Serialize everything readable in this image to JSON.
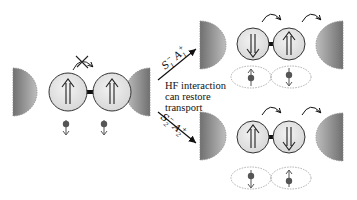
{
  "diagram": {
    "type": "spin-blockade-transport-schematic",
    "caption_lines": [
      "HF interaction",
      "can restore",
      "transport"
    ],
    "arrow_labels": {
      "top": {
        "operator1": "S",
        "sub1": "1",
        "sup1": "−",
        "operator2": "A",
        "sub2": "1",
        "sup2": "+"
      },
      "bottom": {
        "operator1": "S",
        "sub1": "2",
        "sup1": "−",
        "operator2": "A",
        "sub2": "2",
        "sup2": "+"
      }
    },
    "panels": {
      "initial": {
        "dot1_spin": "up",
        "dot2_spin": "up",
        "nuclear1": "down",
        "nuclear2": "down",
        "tunneling": "blocked"
      },
      "top_result": {
        "dot1_spin": "down",
        "dot2_spin": "up",
        "nuclear1": "up",
        "nuclear2": "down",
        "tunneling": "allowed"
      },
      "bottom_result": {
        "dot1_spin": "up",
        "dot2_spin": "down",
        "nuclear1": "down",
        "nuclear2": "up",
        "tunneling": "allowed"
      }
    },
    "colors": {
      "lead_dark": "#6e6e6e",
      "lead_light": "#b8b8b8",
      "dot_fill": "#e6e6e6",
      "stroke": "#333333",
      "nucleus": "#555555",
      "ellipse": "#999999"
    }
  }
}
